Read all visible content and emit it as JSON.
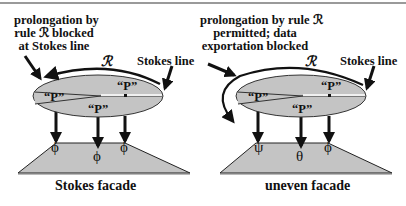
{
  "panels": [
    {
      "annotation_lines": [
        "prolongation by",
        "rule ℛ blocked",
        "at Stokes line"
      ],
      "rule_symbol": "ℛ",
      "stokes_label": "Stokes line",
      "sectors": [
        "“P”",
        "“P”",
        "“P”"
      ],
      "facade_symbols": [
        "ϕ",
        "ϕ",
        "ϕ"
      ],
      "caption": "Stokes facade"
    },
    {
      "annotation_lines": [
        "prolongation by rule ℛ",
        "permitted; data",
        "exportation blocked"
      ],
      "rule_symbol": "ℛ",
      "stokes_label": "Stokes line",
      "sectors": [
        "“P”",
        "“P”",
        "“P”"
      ],
      "facade_symbols": [
        "ψ",
        "θ",
        "ϕ"
      ],
      "caption": "uneven facade"
    }
  ],
  "colors": {
    "fill": "#c4c4c4",
    "stroke": "#1a1a1a",
    "rule_line": "#9a9a9a"
  }
}
